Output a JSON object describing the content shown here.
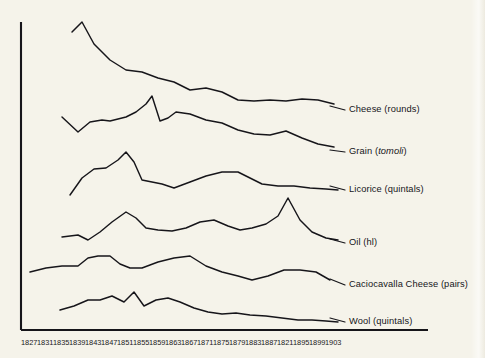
{
  "figure": {
    "background_color": "#f5f3ea",
    "ink_color": "#16151a",
    "axis": {
      "vertical_axis_name": "y-axis-spine",
      "horizontal_axis_name": "x-axis-baseline"
    }
  },
  "chart_data": {
    "type": "line",
    "title": "",
    "subtitle": "",
    "xlabel": "",
    "ylabel": "",
    "grid": false,
    "legend_position": "right-inline-labels",
    "x_axis_note": "Four-year ticks; the eighteenth tick is printed as 1821 in the original scan (sequence implies 1891).",
    "categories": [
      "1827",
      "1831",
      "1835",
      "1839",
      "1843",
      "1847",
      "1851",
      "1855",
      "1859",
      "1863",
      "1867",
      "1871",
      "1875",
      "1879",
      "1883",
      "1887",
      "1821",
      "1895",
      "1899",
      "1903"
    ],
    "tick_x_px": [
      30,
      46,
      62,
      78,
      94,
      110,
      126,
      142,
      158,
      174,
      190,
      206,
      222,
      238,
      254,
      270,
      286,
      302,
      318,
      334
    ],
    "axis_note": "Vertical axis is an unscaled magnitude spine; each series is offset vertically (stacked small-multiple style) with no numeric y ticks.",
    "ylim": null,
    "series": [
      {
        "name": "Cheese (rounds)",
        "unit": "rounds",
        "label_italic_part": "",
        "label_y_px": 110,
        "leader_from_px": [
          330,
          106
        ],
        "leader_to_px": [
          345,
          110
        ],
        "x_px": [
          72,
          82,
          94,
          110,
          126,
          142,
          158,
          174,
          190,
          206,
          222,
          238,
          254,
          270,
          286,
          302,
          318,
          334
        ],
        "y_px": [
          32,
          22,
          44,
          60,
          70,
          72,
          78,
          82,
          90,
          88,
          92,
          100,
          101,
          100,
          101,
          99,
          100,
          104
        ],
        "values_relative": [
          88,
          100,
          78,
          62,
          52,
          50,
          44,
          40,
          32,
          34,
          30,
          22,
          21,
          22,
          21,
          23,
          22,
          18
        ]
      },
      {
        "name": "Grain (tomoli)",
        "unit": "tomoli",
        "label_italic_part": "tomoli",
        "label_y_px": 152,
        "leader_from_px": [
          330,
          150
        ],
        "leader_to_px": [
          345,
          152
        ],
        "x_px": [
          62,
          78,
          90,
          102,
          110,
          126,
          136,
          146,
          152,
          160,
          168,
          176,
          190,
          206,
          222,
          238,
          254,
          270,
          286,
          302,
          318,
          334
        ],
        "y_px": [
          117,
          132,
          122,
          120,
          121,
          117,
          112,
          104,
          96,
          121,
          118,
          112,
          114,
          120,
          123,
          130,
          134,
          135,
          131,
          138,
          144,
          147
        ],
        "values_relative": [
          62,
          42,
          55,
          58,
          57,
          62,
          68,
          78,
          88,
          57,
          60,
          68,
          65,
          57,
          54,
          45,
          40,
          39,
          44,
          36,
          29,
          26
        ]
      },
      {
        "name": "Licorice (quintals)",
        "unit": "quintals",
        "label_y_px": 190,
        "leader_from_px": [
          330,
          186
        ],
        "leader_to_px": [
          345,
          190
        ],
        "x_px": [
          70,
          82,
          94,
          106,
          118,
          126,
          134,
          142,
          152,
          162,
          174,
          190,
          206,
          222,
          238,
          254,
          262,
          278,
          294,
          310,
          326,
          338
        ],
        "y_px": [
          195,
          178,
          169,
          168,
          160,
          152,
          162,
          180,
          182,
          184,
          188,
          182,
          176,
          172,
          172,
          180,
          184,
          186,
          186,
          188,
          189,
          190
        ],
        "values_relative": [
          30,
          52,
          62,
          63,
          72,
          82,
          70,
          48,
          46,
          44,
          40,
          46,
          54,
          58,
          58,
          48,
          44,
          42,
          42,
          40,
          39,
          38
        ]
      },
      {
        "name": "Oil (hl)",
        "unit": "hl",
        "label_y_px": 243,
        "leader_from_px": [
          330,
          239
        ],
        "leader_to_px": [
          345,
          243
        ],
        "x_px": [
          62,
          78,
          88,
          100,
          112,
          126,
          136,
          146,
          158,
          172,
          186,
          200,
          214,
          228,
          240,
          252,
          266,
          278,
          288,
          300,
          312,
          326,
          338
        ],
        "y_px": [
          237,
          235,
          240,
          232,
          222,
          212,
          218,
          228,
          230,
          231,
          228,
          222,
          220,
          226,
          230,
          228,
          224,
          216,
          198,
          220,
          232,
          238,
          240
        ],
        "values_relative": [
          36,
          38,
          32,
          42,
          54,
          66,
          58,
          46,
          44,
          43,
          46,
          54,
          56,
          48,
          44,
          46,
          50,
          60,
          86,
          54,
          40,
          34,
          32
        ]
      },
      {
        "name": "Caciocavalla Cheese (pairs)",
        "unit": "pairs",
        "label_y_px": 285,
        "label_clipped": true,
        "leader_from_px": [
          330,
          279
        ],
        "leader_to_px": [
          345,
          285
        ],
        "x_px": [
          30,
          46,
          62,
          78,
          88,
          98,
          110,
          120,
          130,
          142,
          158,
          174,
          190,
          206,
          222,
          238,
          252,
          268,
          284,
          300,
          316,
          330
        ],
        "y_px": [
          272,
          268,
          266,
          266,
          258,
          256,
          256,
          264,
          268,
          268,
          262,
          258,
          256,
          266,
          272,
          276,
          280,
          276,
          270,
          270,
          272,
          280
        ],
        "values_relative": [
          34,
          40,
          43,
          43,
          54,
          57,
          57,
          46,
          40,
          40,
          48,
          54,
          57,
          44,
          34,
          30,
          26,
          30,
          38,
          38,
          34,
          24
        ]
      },
      {
        "name": "Wool (quintals)",
        "unit": "quintals",
        "label_y_px": 322,
        "leader_from_px": [
          330,
          318
        ],
        "leader_to_px": [
          345,
          322
        ],
        "x_px": [
          60,
          74,
          88,
          100,
          112,
          124,
          134,
          144,
          156,
          168,
          180,
          194,
          208,
          222,
          236,
          250,
          266,
          282,
          298,
          312,
          326,
          338
        ],
        "y_px": [
          310,
          306,
          300,
          300,
          296,
          302,
          292,
          306,
          300,
          298,
          302,
          308,
          312,
          314,
          313,
          315,
          316,
          318,
          320,
          320,
          321,
          322
        ],
        "values_relative": [
          30,
          36,
          44,
          44,
          50,
          42,
          56,
          38,
          46,
          48,
          42,
          34,
          28,
          26,
          27,
          25,
          23,
          21,
          18,
          18,
          17,
          16
        ]
      }
    ]
  }
}
